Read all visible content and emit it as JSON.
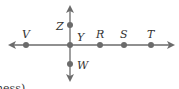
{
  "diagram": {
    "type": "intersecting-lines",
    "line_color": "#6b6b6b",
    "point_color": "#6b6b6b",
    "horizontal_line": {
      "points": [
        {
          "label": "V",
          "x": 26
        },
        {
          "label": "Y",
          "x": 70
        },
        {
          "label": "R",
          "x": 100
        },
        {
          "label": "S",
          "x": 124
        },
        {
          "label": "T",
          "x": 151
        }
      ]
    },
    "vertical_line": {
      "points": [
        {
          "label": "Z",
          "y": 25
        },
        {
          "label": "W",
          "y": 64
        }
      ]
    },
    "intersection_label": "Y",
    "cut_off_text": "ness)"
  }
}
